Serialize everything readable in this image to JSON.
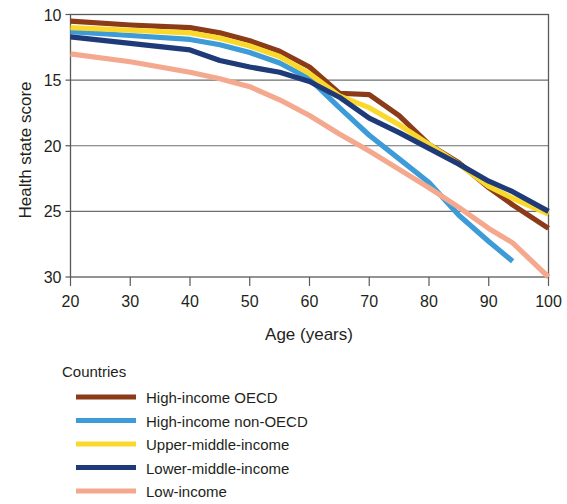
{
  "chart_data": {
    "type": "line",
    "title": "",
    "xlabel": "Age (years)",
    "ylabel": "Health state score",
    "xlim": [
      20,
      100
    ],
    "ylim": [
      10,
      30
    ],
    "y_inverted": true,
    "grid": true,
    "x_ticks": [
      "20",
      "30",
      "40",
      "50",
      "60",
      "70",
      "80",
      "90",
      "100"
    ],
    "y_ticks": [
      "10",
      "15",
      "20",
      "25",
      "30"
    ],
    "legend_position": "below",
    "legend_title": "Countries",
    "x": [
      20,
      30,
      40,
      45,
      50,
      55,
      60,
      65,
      70,
      75,
      80,
      85,
      90,
      94,
      100
    ],
    "series": [
      {
        "name": "High-income OECD",
        "color": "#8C3B18",
        "values": [
          10.5,
          10.8,
          11.0,
          11.4,
          12.0,
          12.8,
          14.0,
          16.0,
          16.1,
          17.7,
          19.9,
          21.3,
          23.2,
          24.5,
          26.3
        ],
        "x_end": 100
      },
      {
        "name": "High-income non-OECD",
        "color": "#3D9BD7",
        "values": [
          11.3,
          11.6,
          11.9,
          12.3,
          12.9,
          13.7,
          14.9,
          17.1,
          19.2,
          21.0,
          22.8,
          25.3,
          27.3,
          28.8,
          null
        ],
        "x_end": 94
      },
      {
        "name": "Upper-middle-income",
        "color": "#FAD92C",
        "values": [
          11.0,
          11.2,
          11.4,
          11.8,
          12.4,
          13.2,
          14.5,
          16.2,
          17.1,
          18.4,
          19.9,
          21.4,
          23.1,
          24.0,
          25.2
        ],
        "x_end": 100
      },
      {
        "name": "Lower-middle-income",
        "color": "#1E3A78",
        "values": [
          11.7,
          12.2,
          12.7,
          13.5,
          14.0,
          14.4,
          15.1,
          16.3,
          17.9,
          19.0,
          20.2,
          21.4,
          22.7,
          23.5,
          25.0
        ],
        "x_end": 100
      },
      {
        "name": "Low-income",
        "color": "#F4A98E",
        "values": [
          13.0,
          13.6,
          14.4,
          14.9,
          15.5,
          16.5,
          17.7,
          19.1,
          20.4,
          21.8,
          23.2,
          24.7,
          26.3,
          27.4,
          31.4
        ],
        "x_end": 100
      }
    ]
  },
  "legend": {
    "title": "Countries",
    "items": [
      {
        "label": "High-income OECD",
        "color": "#8C3B18"
      },
      {
        "label": "High-income non-OECD",
        "color": "#3D9BD7"
      },
      {
        "label": "Upper-middle-income",
        "color": "#FAD92C"
      },
      {
        "label": "Lower-middle-income",
        "color": "#1E3A78"
      },
      {
        "label": "Low-income",
        "color": "#F4A98E"
      }
    ]
  }
}
